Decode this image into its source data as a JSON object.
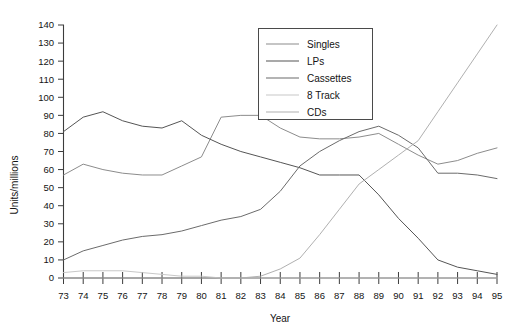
{
  "chart_data": {
    "type": "line",
    "title": "",
    "xlabel": "Year",
    "ylabel": "Units/millions",
    "x": [
      73,
      74,
      75,
      76,
      77,
      78,
      79,
      80,
      81,
      82,
      83,
      84,
      85,
      86,
      87,
      88,
      89,
      90,
      91,
      92,
      93,
      94,
      95
    ],
    "xtick_labels": [
      "73",
      "74",
      "75",
      "76",
      "77",
      "78",
      "79",
      "80",
      "81",
      "82",
      "83",
      "84",
      "85",
      "86",
      "87",
      "88",
      "89",
      "90",
      "91",
      "92",
      "93",
      "94",
      "95"
    ],
    "ytick_labels": [
      "0",
      "10",
      "20",
      "30",
      "40",
      "50",
      "60",
      "70",
      "80",
      "90",
      "100",
      "110",
      "120",
      "130",
      "140"
    ],
    "xlim": [
      73,
      95
    ],
    "ylim": [
      0,
      140
    ],
    "ytick_step": 10,
    "grid": false,
    "legend_position": "top-center-right",
    "series": [
      {
        "name": "Singles",
        "color": "#8c8c8c",
        "values": [
          57,
          63,
          60,
          58,
          57,
          57,
          62,
          67,
          89,
          90,
          90,
          83,
          78,
          77,
          77,
          78,
          80,
          74,
          68,
          63,
          65,
          69,
          72
        ]
      },
      {
        "name": "LPs",
        "color": "#555555",
        "values": [
          81,
          89,
          92,
          87,
          84,
          83,
          87,
          79,
          74,
          70,
          67,
          64,
          61,
          57,
          57,
          57,
          46,
          33,
          22,
          10,
          6,
          4,
          2
        ]
      },
      {
        "name": "Cassettes",
        "color": "#6b6b6b",
        "values": [
          10,
          15,
          18,
          21,
          23,
          24,
          26,
          29,
          32,
          34,
          38,
          48,
          62,
          70,
          76,
          81,
          84,
          79,
          72,
          58,
          58,
          57,
          55
        ]
      },
      {
        "name": "8 Track",
        "color": "#c8c8c8",
        "values": [
          3,
          4,
          4,
          4,
          3,
          2,
          1,
          1,
          0,
          0,
          0,
          0,
          0,
          0,
          0,
          0,
          0,
          0,
          0,
          0,
          0,
          0,
          0
        ]
      },
      {
        "name": "CDs",
        "color": "#b0b0b0",
        "values": [
          0,
          0,
          0,
          0,
          0,
          0,
          0,
          0,
          0,
          0,
          1,
          5,
          11,
          24,
          38,
          52,
          60,
          68,
          76,
          92,
          108,
          124,
          140
        ]
      }
    ]
  },
  "legend": {
    "items": [
      {
        "label": "Singles"
      },
      {
        "label": "LPs"
      },
      {
        "label": "Cassettes"
      },
      {
        "label": "8 Track"
      },
      {
        "label": "CDs"
      }
    ]
  }
}
